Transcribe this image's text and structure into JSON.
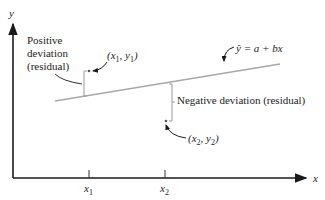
{
  "diagram": {
    "type": "regression-residual-illustration",
    "axes": {
      "x_label": "x",
      "y_label": "y",
      "x_ticks": [
        {
          "label_base": "x",
          "label_sub": "1"
        },
        {
          "label_base": "x",
          "label_sub": "2"
        }
      ]
    },
    "regression_line": {
      "equation": "ŷ = a + bx",
      "color": "#a8a8a8"
    },
    "points": [
      {
        "label": "(x1, y1)",
        "label_base_x": "x",
        "sub1": "1",
        "label_base_y": "y",
        "sub2": "1"
      },
      {
        "label": "(x2, y2)",
        "label_base_x": "x",
        "sub1": "2",
        "label_base_y": "y",
        "sub2": "2"
      }
    ],
    "annotations": {
      "positive_line1": "Positive",
      "positive_line2": "deviation",
      "positive_line3": "(residual)",
      "negative": "Negative deviation (residual)"
    },
    "colors": {
      "axis": "#1a1a1a",
      "line": "#a8a8a8",
      "text": "#222222"
    }
  }
}
